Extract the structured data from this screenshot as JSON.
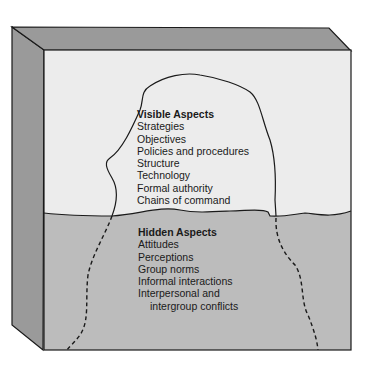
{
  "diagram": {
    "type": "iceberg",
    "colors": {
      "box_side": "#9a9a9a",
      "sky": "#ececec",
      "water": "#bcbcbc",
      "outline": "#1a1a1a"
    },
    "visible": {
      "title": "Visible Aspects",
      "items": [
        "Strategies",
        "Objectives",
        "Policies and procedures",
        "Structure",
        "Technology",
        "Formal authority",
        "Chains of command"
      ]
    },
    "hidden": {
      "title": "Hidden Aspects",
      "items": [
        "Attitudes",
        "Perceptions",
        "Group norms",
        "Informal interactions",
        "Interpersonal and"
      ],
      "continuation": "intergroup conflicts"
    }
  }
}
